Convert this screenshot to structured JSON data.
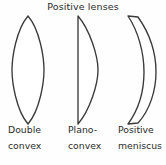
{
  "figure": {
    "title": "Positive lenses",
    "background_color": "#fefefe",
    "stroke_color": "#3a3a3a",
    "fill_color": "#ffffff"
  },
  "lenses": [
    {
      "id": "double-convex",
      "shape": "biconvex",
      "caption_line1": "Double",
      "caption_line2": "convex",
      "outline_path": "M 28 2 C 40 16 44 44 44 56 C 44 68 40 96 28 110 C 16 96 12 68 12 56 C 12 44 16 16 28 2 Z"
    },
    {
      "id": "plano-convex",
      "shape": "plano-convex",
      "caption_line1": "Plano-",
      "caption_line2": "convex",
      "outline_path": "M 22 2 L 22 110 C 34 96 42 70 42 56 C 42 42 34 16 22 2 Z"
    },
    {
      "id": "positive-meniscus",
      "shape": "positive-meniscus",
      "caption_line1": "Positive",
      "caption_line2": "meniscus",
      "outline_path": "M 16 2 L 26 3 C 38 20 44 40 44 58 C 44 76 38 96 26 109 L 16 110 C 27 95 32 76 32 58 C 32 38 26 17 16 2 Z"
    }
  ]
}
